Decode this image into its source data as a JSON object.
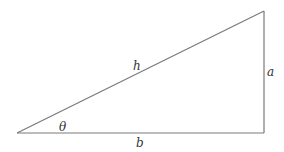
{
  "diagram": {
    "type": "right-triangle",
    "labels": {
      "hypotenuse": "h",
      "opposite": "a",
      "adjacent": "b",
      "angle": "θ"
    },
    "colors": {
      "stroke": "#7a7a7a",
      "text": "#333333",
      "background": "#ffffff"
    }
  }
}
